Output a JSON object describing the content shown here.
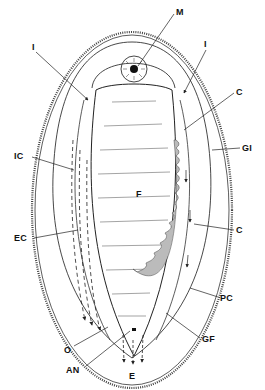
{
  "figure": {
    "labels": {
      "M": "M",
      "I_left": "I",
      "I_right": "I",
      "C_upper": "C",
      "GI": "GI",
      "IC": "IC",
      "F": "F",
      "EC": "EC",
      "C_lower": "C",
      "PC": "PC",
      "O": "O",
      "GF": "GF",
      "AN": "AN",
      "E": "E"
    },
    "colors": {
      "ink": "#222222",
      "background": "#ffffff"
    }
  }
}
